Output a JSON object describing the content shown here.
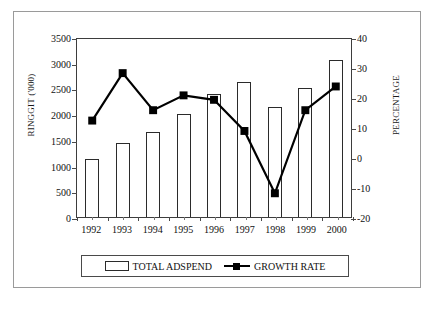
{
  "chart_data": {
    "type": "bar",
    "title": "",
    "subtitle": "",
    "xlabel": "",
    "categories": [
      "1992",
      "1993",
      "1994",
      "1995",
      "1996",
      "1997",
      "1998",
      "1999",
      "2000"
    ],
    "grid": false,
    "legend_position": "bottom",
    "axes": {
      "left": {
        "label": "RINGGIT ('000)",
        "min": 0,
        "max": 3500,
        "step": 500,
        "ticks": [
          "0",
          "500",
          "1000",
          "1500",
          "2000",
          "2500",
          "3000",
          "3500"
        ]
      },
      "right": {
        "label": "PERCENTAGE",
        "min": -20,
        "max": 40,
        "step": 10,
        "ticks": [
          "-20",
          "-10",
          "0",
          "10",
          "20",
          "30",
          "40"
        ]
      }
    },
    "series": [
      {
        "name": "TOTAL ADSPEND",
        "type": "bar",
        "axis": "left",
        "unit": "RINGGIT ('000)",
        "color": "#ffffff",
        "edge_color": "#2b2b2b",
        "values": [
          1130,
          1430,
          1660,
          2010,
          2390,
          2620,
          2140,
          2500,
          3060
        ]
      },
      {
        "name": "GROWTH RATE",
        "type": "line",
        "axis": "right",
        "unit": "PERCENTAGE",
        "color": "#000000",
        "marker": "square",
        "values": [
          12.5,
          28.5,
          16,
          21,
          19.5,
          9,
          -12,
          16,
          24
        ]
      }
    ]
  },
  "legend": {
    "items": [
      {
        "label": "TOTAL ADSPEND",
        "marker": "hollow-bar"
      },
      {
        "label": "GROWTH RATE",
        "marker": "line-square"
      }
    ]
  }
}
